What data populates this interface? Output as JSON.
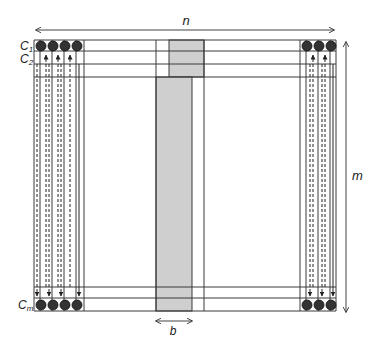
{
  "diagram": {
    "labels": {
      "width": "n",
      "height": "m",
      "block": "b",
      "row1_main": "C",
      "row1_sub": "1",
      "row2_main": "C",
      "row2_sub": "2",
      "rowm_main": "C",
      "rowm_sub": "m"
    },
    "colors": {
      "line": "#3a3a3a",
      "shade": "#cfcfcf",
      "dot": "#333333",
      "dot_edge": "#111111"
    },
    "left_cells": 4,
    "right_cells": 3
  }
}
